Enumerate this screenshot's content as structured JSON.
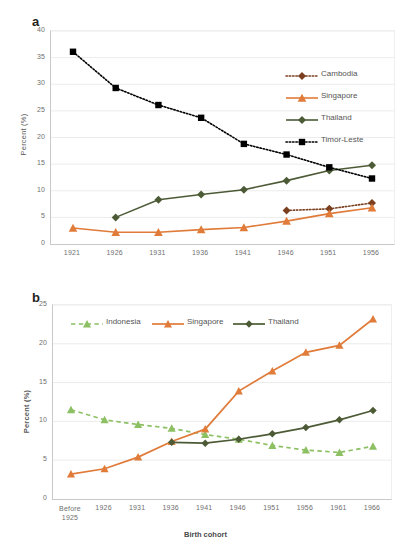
{
  "figure": {
    "panels": [
      {
        "letter": "a",
        "ylabel": "Percent (%)",
        "xlabel": "",
        "yticks": [
          "0",
          "5",
          "10",
          "15",
          "20",
          "25",
          "30",
          "35",
          "40"
        ],
        "xticks": [
          "1921",
          "1926",
          "1931",
          "1936",
          "1941",
          "1946",
          "1951",
          "1956"
        ]
      },
      {
        "letter": "b",
        "ylabel": "Percent (%)",
        "xlabel": "Birth cohort",
        "yticks": [
          "0",
          "5",
          "10",
          "15",
          "20",
          "25"
        ],
        "xticks": [
          "Before 1925",
          "1926",
          "1931",
          "1936",
          "1941",
          "1946",
          "1951",
          "1956",
          "1961",
          "1966"
        ]
      }
    ]
  },
  "colors": {
    "cambodia": "#7b3f20",
    "singapore": "#e07b39",
    "thailand": "#4c5b36",
    "timor_leste": "#000000",
    "indonesia": "#8cc063",
    "grid": "#ececec",
    "axis": "#c9c9c9",
    "text": "#6f6f6f"
  },
  "chart_data": [
    {
      "type": "line",
      "title": "a",
      "xlabel": "",
      "ylabel": "Percent (%)",
      "categories": [
        "1921",
        "1926",
        "1931",
        "1936",
        "1941",
        "1946",
        "1951",
        "1956"
      ],
      "ylim": [
        0,
        40
      ],
      "ytick_step": 5,
      "grid": true,
      "legend_position": "inside-right",
      "series": [
        {
          "name": "Cambodia",
          "color": "#7b3f20",
          "style": "dotted",
          "marker": "diamond",
          "values": [
            null,
            null,
            null,
            null,
            null,
            6.3,
            6.6,
            7.7
          ]
        },
        {
          "name": "Singapore",
          "color": "#e07b39",
          "style": "solid",
          "marker": "triangle",
          "values": [
            3.0,
            2.2,
            2.2,
            2.7,
            3.1,
            4.3,
            5.7,
            6.8
          ]
        },
        {
          "name": "Thailand",
          "color": "#4c5b36",
          "style": "solid",
          "marker": "diamond",
          "values": [
            null,
            5.0,
            8.3,
            9.3,
            10.2,
            11.9,
            13.8,
            14.8
          ]
        },
        {
          "name": "Timor-Leste",
          "color": "#000000",
          "style": "dotted",
          "marker": "square",
          "values": [
            36.1,
            29.3,
            26.1,
            23.7,
            18.8,
            16.8,
            14.4,
            12.3
          ]
        }
      ]
    },
    {
      "type": "line",
      "title": "b",
      "xlabel": "Birth cohort",
      "ylabel": "Percent (%)",
      "categories": [
        "Before 1925",
        "1926",
        "1931",
        "1936",
        "1941",
        "1946",
        "1951",
        "1956",
        "1961",
        "1966"
      ],
      "ylim": [
        0,
        25
      ],
      "ytick_step": 5,
      "grid": true,
      "legend_position": "inside-top-left",
      "series": [
        {
          "name": "Indonesia",
          "color": "#8cc063",
          "style": "dashed",
          "marker": "triangle",
          "values": [
            11.5,
            10.2,
            9.6,
            9.1,
            8.3,
            7.7,
            6.9,
            6.3,
            6.0,
            6.8
          ]
        },
        {
          "name": "Singapore",
          "color": "#e07b39",
          "style": "solid",
          "marker": "triangle",
          "values": [
            3.2,
            3.9,
            5.4,
            7.4,
            9.0,
            13.9,
            16.5,
            18.9,
            19.8,
            23.2
          ]
        },
        {
          "name": "Thailand",
          "color": "#4c5b36",
          "style": "solid",
          "marker": "diamond",
          "values": [
            null,
            null,
            null,
            7.3,
            7.2,
            7.7,
            8.4,
            9.2,
            10.2,
            11.4
          ]
        }
      ]
    }
  ]
}
